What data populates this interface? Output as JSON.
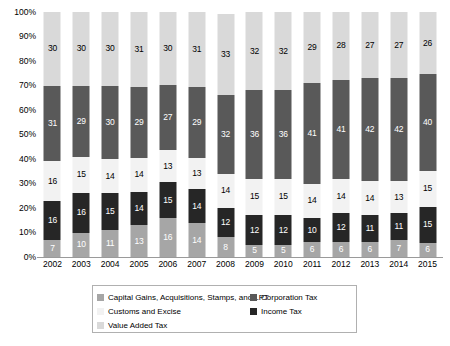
{
  "chart_data": {
    "type": "bar",
    "subtype": "stacked-100-percent",
    "title": "",
    "xlabel": "",
    "ylabel": "",
    "ylim": [
      0,
      100
    ],
    "ytick_labels": [
      "0%",
      "10%",
      "20%",
      "30%",
      "40%",
      "50%",
      "60%",
      "70%",
      "80%",
      "90%",
      "100%"
    ],
    "ytick_values": [
      0,
      10,
      20,
      30,
      40,
      50,
      60,
      70,
      80,
      90,
      100
    ],
    "grid": false,
    "legend_position": "bottom",
    "categories": [
      "2002",
      "2003",
      "2004",
      "2005",
      "2006",
      "2007",
      "2008",
      "2009",
      "2010",
      "2011",
      "2012",
      "2013",
      "2014",
      "2015"
    ],
    "series": [
      {
        "name": "Capital Gains, Acquisitions, Stamps, and LPT",
        "color": "#a6a6a6",
        "label_color": "#ffffff",
        "values": [
          7,
          10,
          11,
          13,
          16,
          14,
          8,
          5,
          5,
          6,
          6,
          6,
          7,
          6
        ]
      },
      {
        "name": "Income Tax",
        "color": "#262626",
        "label_color": "#ffffff",
        "values": [
          16,
          16,
          15,
          14,
          15,
          14,
          12,
          12,
          12,
          10,
          12,
          11,
          11,
          15
        ]
      },
      {
        "name": "Customs and Excise",
        "color": "#f2f2f2",
        "label_color": "#000000",
        "values": [
          16,
          15,
          14,
          14,
          13,
          13,
          14,
          15,
          15,
          14,
          14,
          14,
          13,
          15
        ]
      },
      {
        "name": "Corporation Tax",
        "color": "#595959",
        "label_color": "#ffffff",
        "values": [
          31,
          29,
          30,
          29,
          27,
          29,
          32,
          36,
          36,
          41,
          41,
          42,
          42,
          40
        ]
      },
      {
        "name": "Value Added Tax",
        "color": "#d9d9d9",
        "label_color": "#000000",
        "values": [
          30,
          30,
          30,
          31,
          30,
          31,
          33,
          32,
          32,
          29,
          28,
          27,
          27,
          26
        ]
      }
    ]
  },
  "legend": {
    "left_column": [
      "Capital Gains, Acquisitions, Stamps, and LPT",
      "Customs and Excise",
      "Value Added Tax"
    ],
    "right_column": [
      "Corporation Tax",
      "Income Tax"
    ]
  }
}
